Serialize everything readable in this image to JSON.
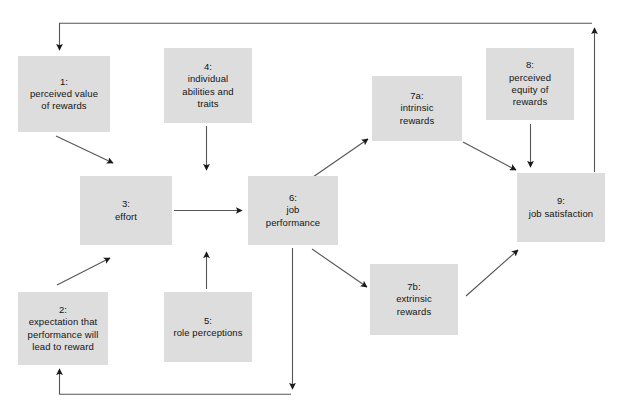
{
  "diagram": {
    "type": "flow-diagram",
    "background_color": "#ffffff",
    "node_fill_color": "#dddddd",
    "line_color": "#4d4d4d",
    "text_color": "#141414",
    "nodes": [
      {
        "id": "node-1",
        "name": "perceived-value-of-rewards",
        "label": "1:\nperceived value\nof rewards",
        "x": 18,
        "y": 56,
        "w": 92,
        "h": 76
      },
      {
        "id": "node-2",
        "name": "expectation-performance-leads-to-reward",
        "label": "2:\nexpectation that\nperformance will\nlead to reward",
        "x": 18,
        "y": 292,
        "w": 90,
        "h": 73
      },
      {
        "id": "node-3",
        "name": "effort",
        "label": "3:\neffort",
        "x": 80,
        "y": 176,
        "w": 92,
        "h": 69
      },
      {
        "id": "node-4",
        "name": "individual-abilities-and-traits",
        "label": "4:\nindividual\nabilities and\ntraits",
        "x": 164,
        "y": 48,
        "w": 88,
        "h": 75
      },
      {
        "id": "node-5",
        "name": "role-perceptions",
        "label": "5:\nrole perceptions",
        "x": 164,
        "y": 292,
        "w": 88,
        "h": 70
      },
      {
        "id": "node-6",
        "name": "job-performance",
        "label": "6:\njob\nperformance",
        "x": 248,
        "y": 176,
        "w": 90,
        "h": 69
      },
      {
        "id": "node-7a",
        "name": "intrinsic-rewards",
        "label": "7a:\nintrinsic\nrewards",
        "x": 372,
        "y": 76,
        "w": 90,
        "h": 65
      },
      {
        "id": "node-7b",
        "name": "extrinsic-rewards",
        "label": "7b:\nextrinsic\nrewards",
        "x": 370,
        "y": 264,
        "w": 88,
        "h": 71
      },
      {
        "id": "node-8",
        "name": "perceived-equity-of-rewards",
        "label": "8:\nperceived\nequity of\nrewards",
        "x": 486,
        "y": 48,
        "w": 88,
        "h": 72
      },
      {
        "id": "node-9",
        "name": "job-satisfaction",
        "label": "9:\njob satisfaction",
        "x": 517,
        "y": 173,
        "w": 88,
        "h": 69
      }
    ],
    "edges": [
      {
        "name": "edge-feedback-satisfaction-to-perceived-value",
        "from": "node-9",
        "to": "node-1"
      },
      {
        "name": "edge-perceived-value-to-effort",
        "from": "node-1",
        "to": "node-3"
      },
      {
        "name": "edge-expectation-to-effort",
        "from": "node-2",
        "to": "node-3"
      },
      {
        "name": "edge-effort-to-job-performance",
        "from": "node-3",
        "to": "node-6"
      },
      {
        "name": "edge-abilities-to-job-performance",
        "from": "node-4",
        "to": "node-6"
      },
      {
        "name": "edge-role-perceptions-to-job-performance",
        "from": "node-5",
        "to": "node-6"
      },
      {
        "name": "edge-job-performance-to-intrinsic-rewards",
        "from": "node-6",
        "to": "node-7a"
      },
      {
        "name": "edge-job-performance-to-extrinsic-rewards",
        "from": "node-6",
        "to": "node-7b"
      },
      {
        "name": "edge-intrinsic-rewards-to-job-satisfaction",
        "from": "node-7a",
        "to": "node-9"
      },
      {
        "name": "edge-extrinsic-rewards-to-job-satisfaction",
        "from": "node-7b",
        "to": "node-9"
      },
      {
        "name": "edge-perceived-equity-to-job-satisfaction",
        "from": "node-8",
        "to": "node-9"
      },
      {
        "name": "edge-feedback-job-performance-to-expectation",
        "from": "node-6",
        "to": "node-2"
      }
    ]
  }
}
